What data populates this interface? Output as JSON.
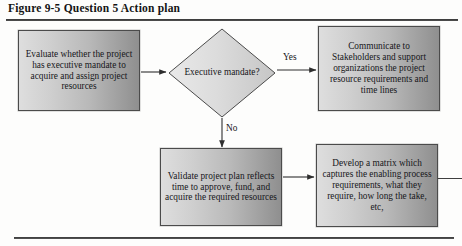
{
  "figure": {
    "caption": "Figure 9-5  Question 5 Action plan"
  },
  "diagram": {
    "type": "flowchart",
    "nodes": [
      {
        "id": "evaluate",
        "shape": "process",
        "text": "Evaluate whether the project has executive mandate to acquire and assign project resources"
      },
      {
        "id": "decision",
        "shape": "decision",
        "text": "Executive mandate?"
      },
      {
        "id": "communicate",
        "shape": "process",
        "text": "Communicate to Stakeholders and support organizations the project resource requirements and time lines"
      },
      {
        "id": "validate",
        "shape": "process",
        "text": "Validate project plan reflects time to approve, fund, and acquire the required resources"
      },
      {
        "id": "matrix",
        "shape": "process",
        "text": "Develop a matrix which captures the enabling process requirements, what they require, how long the take, etc,"
      }
    ],
    "edges": [
      {
        "from": "evaluate",
        "to": "decision",
        "label": ""
      },
      {
        "from": "decision",
        "to": "communicate",
        "label": "Yes"
      },
      {
        "from": "decision",
        "to": "validate",
        "label": "No"
      },
      {
        "from": "validate",
        "to": "matrix",
        "label": ""
      }
    ],
    "labels": {
      "yes": "Yes",
      "no": "No"
    },
    "colors": {
      "box_fill_light": "#dedede",
      "box_fill_dark": "#8f8f8f",
      "border": "#4b4b4b",
      "text": "#16161a",
      "rule": "#3a3a3a"
    }
  }
}
